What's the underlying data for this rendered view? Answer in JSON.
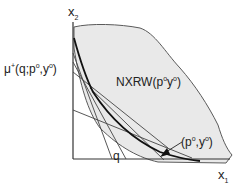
{
  "diagram": {
    "axes": {
      "x_label_base": "x",
      "x_label_sub": "1",
      "y_label_base": "x",
      "y_label_sub": "2"
    },
    "labels": {
      "mu": {
        "prefix": "μ",
        "sup_plus": "+",
        "open": "(q;p",
        "sup_o1": "o",
        "mid": ",y",
        "sup_o2": "o",
        "close": ")"
      },
      "region": {
        "prefix": "NXRW(p",
        "sup_o1": "o",
        "mid": "y",
        "sup_o2": "o",
        "close": ")"
      },
      "q": "q",
      "point": {
        "open": "(p",
        "sup_o1": "o",
        "mid": ",y",
        "sup_o2": "o",
        "close": ")"
      }
    },
    "colors": {
      "region_fill": "#e8e8e8",
      "region_stroke": "#555555",
      "line": "#333333",
      "boundary": "#111111"
    }
  }
}
